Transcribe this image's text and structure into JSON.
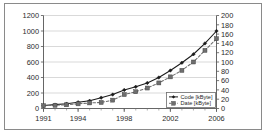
{
  "chart_data": {
    "type": "line",
    "title": "",
    "xlabel": "",
    "ylabel": "",
    "x": [
      1991,
      1992,
      1993,
      1994,
      1995,
      1996,
      1997,
      1998,
      1999,
      2000,
      2001,
      2002,
      2003,
      2004,
      2005,
      2006
    ],
    "xtick_labels": [
      "1991",
      "1994",
      "1998",
      "2002",
      "2006"
    ],
    "xticks": [
      1991,
      1994,
      1998,
      2002,
      2006
    ],
    "grid": true,
    "legend_position": "inside-bottom-right",
    "axes": [
      {
        "id": "left",
        "label": "",
        "ylim": [
          0,
          1200
        ],
        "ticks": [
          0,
          200,
          400,
          600,
          800,
          1000,
          1200
        ],
        "tick_labels": [
          "0",
          "200",
          "400",
          "600",
          "800",
          "1000",
          "1200"
        ]
      },
      {
        "id": "right",
        "label": "",
        "ylim": [
          0,
          200
        ],
        "ticks": [
          0,
          20,
          40,
          60,
          80,
          100,
          120,
          140,
          160,
          180,
          200
        ],
        "tick_labels": [
          "0",
          "20",
          "40",
          "60",
          "80",
          "100",
          "120",
          "140",
          "160",
          "180",
          "200"
        ]
      }
    ],
    "series": [
      {
        "name": "Code [kByte]",
        "axis": "left",
        "unit": "kByte",
        "marker": "diamond",
        "line_style": "solid",
        "color": "#1a1a1a",
        "values": [
          40,
          50,
          62,
          80,
          100,
          140,
          180,
          240,
          280,
          330,
          400,
          490,
          590,
          700,
          840,
          1000
        ]
      },
      {
        "name": "Date [kByte]",
        "axis": "right",
        "unit": "kByte",
        "marker": "square",
        "line_style": "dashed",
        "color": "#6e6e6e",
        "values": [
          6,
          7,
          8,
          10,
          12,
          13,
          18,
          30,
          36,
          44,
          55,
          68,
          82,
          100,
          125,
          150
        ]
      }
    ]
  },
  "legend": {
    "entries": [
      {
        "label": "Code [kByte]"
      },
      {
        "label": "Date [kByte]"
      }
    ]
  }
}
